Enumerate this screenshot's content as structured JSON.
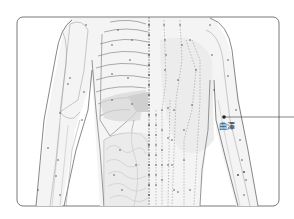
{
  "figure": {
    "frame": {
      "x": 17,
      "y": 17,
      "width": 262,
      "height": 189,
      "radius": 6,
      "stroke": "#555555"
    },
    "colors": {
      "outline": "#555555",
      "line": "#8a8a8a",
      "point": "#555555",
      "organ_shade": "#d6d6d6",
      "skin_shade": "#efefef",
      "leader": "#333333"
    }
  },
  "annotation": {
    "label": "曲澤",
    "point": {
      "x": 224,
      "y": 117
    },
    "leader_end_x": 294,
    "label_pos": {
      "x": 218,
      "y": 123
    }
  }
}
